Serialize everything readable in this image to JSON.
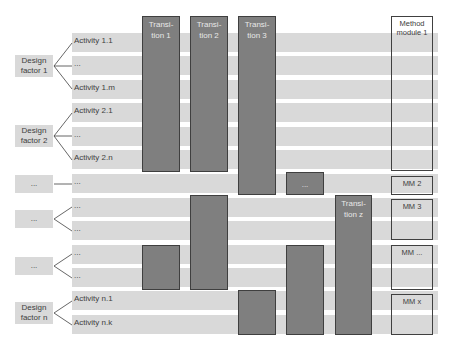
{
  "design_factors": [
    {
      "label": "Design factor 1"
    },
    {
      "label": "Design factor 2"
    },
    {
      "label": "..."
    },
    {
      "label": "..."
    },
    {
      "label": "..."
    },
    {
      "label": "Design factor n"
    }
  ],
  "activities": [
    "Activity 1.1",
    "...",
    "Activity 1.m",
    "Activity 2.1",
    "...",
    "Activity 2.n",
    "...",
    "...",
    "...",
    "...",
    "...",
    "Activity n.1",
    "Activity n.k"
  ],
  "transitions": {
    "t1": "Transi-tion 1",
    "t2": "Transi-tion 2",
    "t3": "Transi-tion 3",
    "ellipsis": "...",
    "tz": "Transi-tion z"
  },
  "method_modules": {
    "mm1": "Method module 1",
    "mm2": "MM 2",
    "mm3": "MM 3",
    "mm_ellipsis": "MM ...",
    "mmx": "MM x"
  },
  "colors": {
    "row_band": "#d9d9d9",
    "transition_fill": "#7f7f7f",
    "transition_border": "#3f3f3f",
    "module_border": "#404040",
    "text": "#404040"
  }
}
